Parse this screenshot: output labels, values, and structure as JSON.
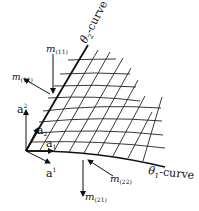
{
  "diagram": {
    "curves": {
      "theta2": {
        "symbol": "θ",
        "sub": "2",
        "suffix": "-curve"
      },
      "theta1": {
        "symbol": "θ",
        "sub": "1",
        "suffix": "-curve"
      }
    },
    "vectors": {
      "a_sup2": {
        "base": "a",
        "sup": "2"
      },
      "a_sup1": {
        "base": "a",
        "sup": "1"
      },
      "a_sub2": {
        "base": "a",
        "sub": "2"
      },
      "a_sub1": {
        "base": "a",
        "sub": "1"
      }
    },
    "moments": {
      "m11": {
        "base": "m",
        "sub": "(11)"
      },
      "m12": {
        "base": "m",
        "sub": "(12)"
      },
      "m22": {
        "base": "m",
        "sub": "(22)"
      },
      "m21": {
        "base": "m",
        "sub": "(21)"
      }
    },
    "colors": {
      "ink": "#111111",
      "background": "#ffffff"
    }
  }
}
